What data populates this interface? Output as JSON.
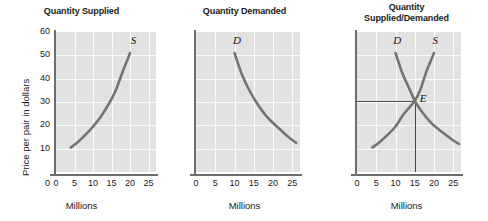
{
  "figure": {
    "ylabel": "Price per pair in dollars",
    "xlabel": "Millions"
  },
  "chart_data": [
    {
      "type": "line",
      "title": "Quantity Supplied",
      "xlabel": "Millions",
      "ylabel": "Price per pair in dollars",
      "xlim": [
        0,
        27
      ],
      "ylim": [
        0,
        60
      ],
      "xticks": [
        "0",
        "5",
        "10",
        "15",
        "20",
        "25"
      ],
      "yticks": [
        "10",
        "20",
        "30",
        "40",
        "50",
        "60"
      ],
      "origin_tick": "0",
      "grid": true,
      "series": [
        {
          "name": "S",
          "label": "S",
          "label_x": 20.2,
          "label_y": 56,
          "x": [
            4.0,
            6.0,
            8.0,
            10.0,
            12.0,
            14.0,
            16.0,
            18.0,
            19.0,
            20.0
          ],
          "y": [
            10.5,
            13.0,
            16.0,
            19.5,
            23.5,
            28.5,
            34.5,
            43.0,
            47.0,
            51.0
          ]
        }
      ]
    },
    {
      "type": "line",
      "title": "Quantity Demanded",
      "xlabel": "Millions",
      "ylabel": "",
      "xlim": [
        0,
        27
      ],
      "ylim": [
        0,
        60
      ],
      "xticks": [
        "0",
        "5",
        "10",
        "15",
        "20",
        "25"
      ],
      "yticks": [],
      "origin_tick": "0",
      "grid": true,
      "series": [
        {
          "name": "D",
          "label": "D",
          "label_x": 9.6,
          "label_y": 56,
          "x": [
            10.0,
            11.0,
            12.0,
            14.0,
            16.0,
            18.0,
            20.0,
            22.0,
            24.0,
            26.0
          ],
          "y": [
            51.0,
            46.0,
            41.5,
            34.5,
            29.0,
            24.5,
            21.0,
            18.0,
            15.0,
            12.5
          ]
        }
      ]
    },
    {
      "type": "line",
      "title": "Quantity\nSupplied/Demanded",
      "title_line1": "Quantity",
      "title_line2": "Supplied/Demanded",
      "xlabel": "Millions",
      "ylabel": "",
      "xlim": [
        0,
        27
      ],
      "ylim": [
        0,
        60
      ],
      "xticks": [
        "0",
        "5",
        "10",
        "15",
        "20",
        "25"
      ],
      "yticks": [],
      "origin_tick": "0",
      "grid": true,
      "equilibrium": {
        "label": "E",
        "x": 15,
        "y": 30.5,
        "label_x": 16.3,
        "label_y": 31.5
      },
      "series": [
        {
          "name": "D",
          "label": "D",
          "label_x": 9.4,
          "label_y": 56,
          "x": [
            10.0,
            11.0,
            12.0,
            13.5,
            15.0,
            17.0,
            19.0,
            21.0,
            23.0,
            25.0,
            26.5
          ],
          "y": [
            51.0,
            46.0,
            41.5,
            36.0,
            30.5,
            25.5,
            21.5,
            18.5,
            16.0,
            13.5,
            12.0
          ]
        },
        {
          "name": "S",
          "label": "S",
          "label_x": 19.6,
          "label_y": 56,
          "x": [
            4.0,
            6.0,
            8.0,
            10.0,
            12.0,
            13.5,
            15.0,
            16.5,
            18.0,
            19.0,
            20.0
          ],
          "y": [
            10.5,
            13.0,
            16.0,
            19.5,
            24.5,
            27.5,
            30.5,
            35.5,
            43.0,
            47.0,
            51.0
          ]
        }
      ]
    }
  ],
  "style": {
    "plot_background": "#e2e2e2",
    "gridline_color": "#fbfbfb",
    "curve_color": "#737373",
    "axis_color": "#6d6d6d",
    "text_color": "#1a1a1a",
    "guide_color": "#4a4a4a"
  }
}
